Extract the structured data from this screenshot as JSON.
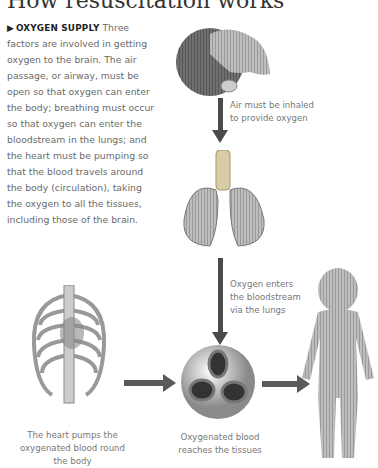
{
  "header": {
    "title": "How resuscitation works"
  },
  "intro": {
    "marker": "▶",
    "lead": "OXYGEN SUPPLY",
    "body": " Three factors are involved in getting oxygen to the brain. The air passage, or airway, must be open so that oxygen can enter the body; breathing must occur so that oxygen can enter the bloodstream in the lungs; and the heart must be pumping so that the blood travels around the body (circulation), taking the oxygen to all the tissues, including those of the brain."
  },
  "captions": {
    "head": "Air must be inhaled\nto provide oxygen",
    "lungs": "Oxygen enters\nthe bloodstream\nvia the lungs",
    "heart": "The heart pumps the\noxygenated blood round\nthe body",
    "blood": "Oxygenated blood\nreaches the tissues"
  },
  "illustrations": {
    "head": "head-tilted-back-illustration",
    "lungs": "lungs-and-trachea-illustration",
    "ribcage": "ribcage-with-heart-illustration",
    "blood_cells": "red-blood-cells-illustration",
    "child": "child-body-illustration"
  },
  "colors": {
    "arrow": "#4a4a4a",
    "text": "#6a6a6a",
    "lead": "#222222"
  }
}
